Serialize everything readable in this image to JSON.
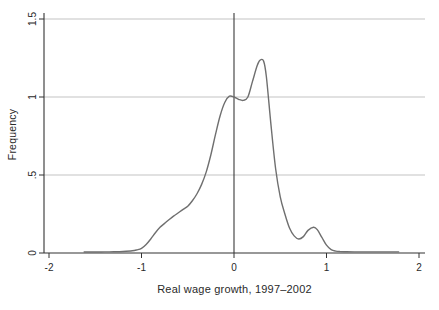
{
  "chart_data": {
    "type": "line",
    "subtype": "kernel-density",
    "title": "",
    "xlabel": "Real wage growth, 1997–2002",
    "ylabel": "Frequency",
    "xlim": [
      -2.05,
      2.06
    ],
    "ylim": [
      0,
      1.54
    ],
    "grid": {
      "horizontal": true,
      "vertical": false
    },
    "legend": "none",
    "reference_line_x": 0,
    "xticks": [
      {
        "value": -2,
        "label": "-2"
      },
      {
        "value": -1,
        "label": "-1"
      },
      {
        "value": 0,
        "label": "0"
      },
      {
        "value": 1,
        "label": "1"
      },
      {
        "value": 2,
        "label": "2"
      }
    ],
    "yticks": [
      {
        "value": 0,
        "label": "0"
      },
      {
        "value": 0.5,
        "label": ".5"
      },
      {
        "value": 1,
        "label": "1"
      },
      {
        "value": 1.5,
        "label": "1.5"
      }
    ],
    "series": [
      {
        "name": "density",
        "x": [
          -1.62,
          -1.5,
          -1.4,
          -1.3,
          -1.2,
          -1.1,
          -1.05,
          -1.0,
          -0.95,
          -0.9,
          -0.85,
          -0.8,
          -0.75,
          -0.7,
          -0.65,
          -0.62,
          -0.55,
          -0.5,
          -0.45,
          -0.4,
          -0.35,
          -0.3,
          -0.25,
          -0.2,
          -0.15,
          -0.1,
          -0.05,
          0.0,
          0.05,
          0.1,
          0.15,
          0.2,
          0.25,
          0.28,
          0.32,
          0.35,
          0.4,
          0.45,
          0.5,
          0.55,
          0.6,
          0.65,
          0.7,
          0.75,
          0.8,
          0.86,
          0.9,
          0.95,
          1.0,
          1.05,
          1.1,
          1.15,
          1.2,
          1.3,
          1.5,
          1.78
        ],
        "y": [
          0.006,
          0.006,
          0.007,
          0.008,
          0.01,
          0.014,
          0.02,
          0.03,
          0.055,
          0.09,
          0.13,
          0.165,
          0.19,
          0.215,
          0.238,
          0.25,
          0.28,
          0.3,
          0.335,
          0.38,
          0.44,
          0.52,
          0.63,
          0.76,
          0.88,
          0.965,
          1.005,
          1.0,
          0.985,
          0.978,
          1.0,
          1.1,
          1.2,
          1.235,
          1.23,
          1.13,
          0.82,
          0.54,
          0.36,
          0.25,
          0.16,
          0.11,
          0.09,
          0.105,
          0.145,
          0.165,
          0.15,
          0.1,
          0.05,
          0.022,
          0.012,
          0.009,
          0.008,
          0.007,
          0.007,
          0.007
        ]
      }
    ],
    "colors": {
      "background": "#ffffff",
      "curve": "#6f6f6f",
      "grid": "#c3c3c3",
      "axis": "#333333",
      "reference_line": "#3a3a3a",
      "text": "#2a2a2a"
    }
  }
}
